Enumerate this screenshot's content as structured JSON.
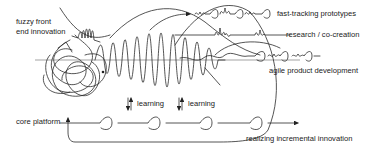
{
  "diagram": {
    "labels": {
      "fuzzy_front_line1": "fuzzy front",
      "fuzzy_front_line2": "end innovation",
      "fast_tracking": "fast-tracking prototypes",
      "research": "research / co-creation",
      "agile": "agile product development",
      "core_platform": "core platform",
      "learning_1": "learning",
      "learning_2": "learning",
      "realizing": "realizing incremental innovation"
    },
    "colors": {
      "ink": "#2a2a2a",
      "background": "#ffffff"
    }
  }
}
